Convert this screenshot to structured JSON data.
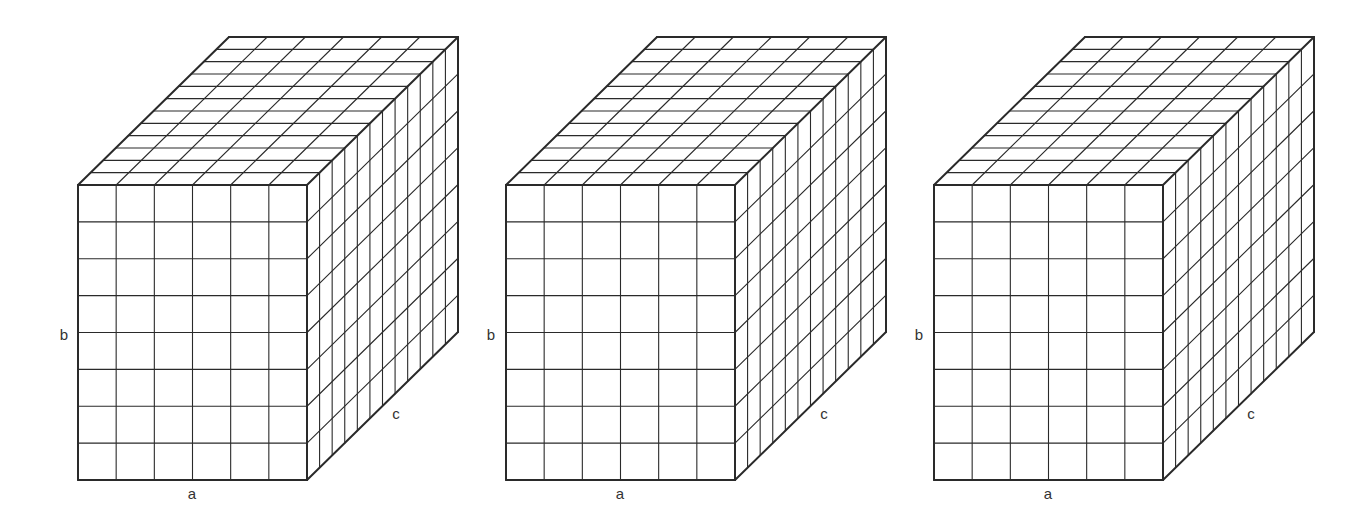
{
  "diagram": {
    "line_color": "#2a2a2a",
    "background": "#ffffff",
    "cubes": [
      {
        "id": "box-1",
        "dims": {
          "a": 6,
          "b": 8,
          "c": 12
        },
        "front_origin": [
          78,
          185
        ],
        "front_size": [
          229,
          295
        ],
        "depth_offset": [
          151,
          -148
        ],
        "labels": {
          "a": {
            "text": "a",
            "pos": [
              192,
              493
            ]
          },
          "b": {
            "text": "b",
            "pos": [
              64,
              334
            ]
          },
          "c": {
            "text": "c",
            "pos": [
              396,
              413
            ]
          }
        }
      },
      {
        "id": "box-2",
        "dims": {
          "a": 6,
          "b": 8,
          "c": 12
        },
        "front_origin": [
          506,
          185
        ],
        "front_size": [
          229,
          295
        ],
        "depth_offset": [
          151,
          -148
        ],
        "labels": {
          "a": {
            "text": "a",
            "pos": [
              620,
              493
            ]
          },
          "b": {
            "text": "b",
            "pos": [
              491,
              334
            ]
          },
          "c": {
            "text": "c",
            "pos": [
              824,
              413
            ]
          }
        }
      },
      {
        "id": "box-3",
        "dims": {
          "a": 6,
          "b": 8,
          "c": 12
        },
        "front_origin": [
          934,
          185
        ],
        "front_size": [
          229,
          295
        ],
        "depth_offset": [
          151,
          -148
        ],
        "labels": {
          "a": {
            "text": "a",
            "pos": [
              1048,
              493
            ]
          },
          "b": {
            "text": "b",
            "pos": [
              919,
              334
            ]
          },
          "c": {
            "text": "c",
            "pos": [
              1251,
              413
            ]
          }
        }
      }
    ]
  }
}
